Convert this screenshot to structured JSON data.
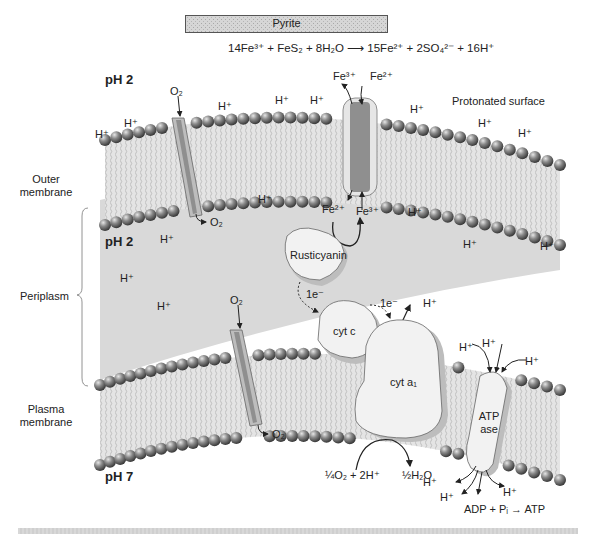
{
  "diagram": {
    "title_bar": "Pyrite",
    "equation": {
      "left": "14Fe³⁺ + FeS₂ + 8H₂O",
      "arrow": "⟶",
      "right": "15Fe²⁺ + 2SO₄²⁻ + 16H⁺"
    },
    "regions": {
      "outside_ph": "pH 2",
      "periplasm_ph": "pH 2",
      "cytoplasm_ph": "pH 7",
      "protonated_surface": "Protonated surface"
    },
    "side_labels": {
      "outer_membrane": [
        "Outer",
        "membrane"
      ],
      "periplasm": "Periplasm",
      "plasma_membrane": [
        "Plasma",
        "membrane"
      ]
    },
    "species": {
      "o2": "O₂",
      "fe3": "Fe³⁺",
      "fe2": "Fe²⁺",
      "h_plus": "H⁺",
      "electron": "1e⁻"
    },
    "proteins": {
      "rusticyanin": "Rusticyanin",
      "cyt_c": "cyt c",
      "cyt_a1": "cyt a₁",
      "atpase_line1": "ATP",
      "atpase_line2": "ase"
    },
    "reactions": {
      "oxygen_reduction_left": "¼O₂ + 2H⁺",
      "oxygen_reduction_right": "½H₂O",
      "atp_synthesis": "ADP + Pᵢ → ATP"
    },
    "colors": {
      "periplasm_fill": "#d9d9d9",
      "bead": "#6e6e6e",
      "protein_fill": "#f2f2f2",
      "protein_shadow": "#bdbdbd",
      "pyrite_bar": "#cfcfcf"
    }
  }
}
